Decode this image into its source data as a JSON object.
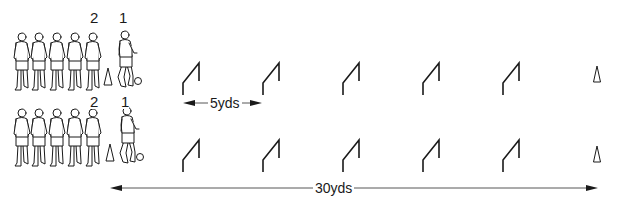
{
  "diagram": {
    "type": "soccer dribbling drill",
    "colors": {
      "line": "#1a1a1a",
      "background": "#ffffff"
    },
    "rows": [
      {
        "id": "top",
        "player_labels": [
          {
            "text": "2",
            "x": 95,
            "y": 10
          },
          {
            "text": "1",
            "x": 120,
            "y": 10
          }
        ],
        "waiting_players": 5,
        "start_cone_x": 108,
        "ball_x": 138,
        "hurdle_x": [
          183,
          263,
          343,
          423,
          503
        ],
        "end_cone_x": 597,
        "baseline_y": 95
      },
      {
        "id": "bottom",
        "player_labels": [
          {
            "text": "2",
            "x": 93,
            "y": 94
          },
          {
            "text": "1",
            "x": 124,
            "y": 94
          }
        ],
        "waiting_players": 5,
        "start_cone_x": 110,
        "ball_x": 140,
        "hurdle_x": [
          183,
          263,
          343,
          423,
          503
        ],
        "end_cone_x": 597,
        "baseline_y": 172
      }
    ],
    "measurements": {
      "spacing": {
        "label": "5yds",
        "from_x": 183,
        "to_x": 262,
        "y": 103
      },
      "total": {
        "label": "30yds",
        "from_x": 110,
        "to_x": 598,
        "y": 188
      }
    }
  }
}
